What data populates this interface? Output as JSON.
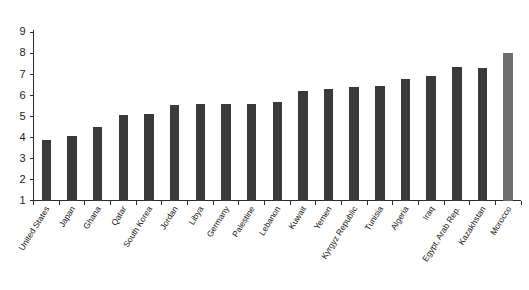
{
  "chart_data": {
    "type": "bar",
    "title": "",
    "subtitle": "",
    "xlabel": "",
    "ylabel": "",
    "ylim": [
      1,
      9
    ],
    "ytick_values": [
      1,
      2,
      3,
      4,
      5,
      6,
      7,
      8,
      9
    ],
    "ytick_labels": [
      "1",
      "2",
      "3",
      "4",
      "5",
      "6",
      "7",
      "8",
      "9"
    ],
    "grid": false,
    "legend": false,
    "legend_position": "none",
    "categories": [
      "United States",
      "Japan",
      "Ghana",
      "Qatar",
      "South Korea",
      "Jordan",
      "Libya",
      "Germany",
      "Palestine",
      "Lebanon",
      "Kuwait",
      "Yemen",
      "Kyrgyz Republic",
      "Tunisia",
      "Algeria",
      "Iraq",
      "Egypt, Arab Rep.",
      "Kazakhstan",
      "Morocco"
    ],
    "values": [
      3.85,
      4.05,
      4.5,
      5.05,
      5.1,
      5.55,
      5.6,
      5.6,
      5.6,
      5.7,
      6.2,
      6.3,
      6.4,
      6.45,
      6.75,
      6.9,
      7.35,
      7.3,
      8.0
    ],
    "bar_colors": [
      "#3a3a3a",
      "#3a3a3a",
      "#3a3a3a",
      "#3a3a3a",
      "#3a3a3a",
      "#3a3a3a",
      "#3a3a3a",
      "#3a3a3a",
      "#3a3a3a",
      "#3a3a3a",
      "#3a3a3a",
      "#3a3a3a",
      "#3a3a3a",
      "#3a3a3a",
      "#3a3a3a",
      "#3a3a3a",
      "#3a3a3a",
      "#3a3a3a",
      "#6e6e6e"
    ],
    "colors": {
      "bar_default": "#3a3a3a",
      "bar_highlight": "#6e6e6e",
      "axis": "#2b2b2b",
      "text": "#141414",
      "background": "#ffffff"
    }
  }
}
